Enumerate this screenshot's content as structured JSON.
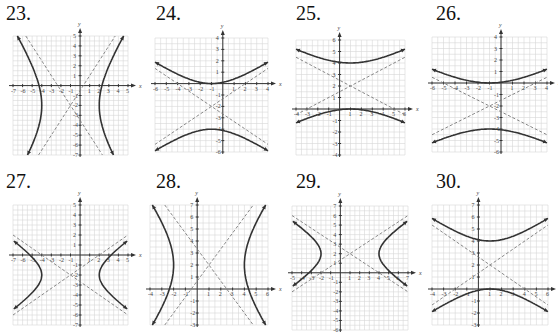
{
  "chart_data": [
    {
      "id": "23",
      "type": "line",
      "title": "23.",
      "xlabel": "x",
      "ylabel": "y",
      "xlim": [
        -7,
        5
      ],
      "ylim": [
        -7,
        5
      ],
      "grid": true,
      "orientation": "horizontal",
      "center": [
        -1,
        -2
      ],
      "a": 3,
      "b": 4.5,
      "xticks": [
        -7,
        -6,
        -5,
        -4,
        -3,
        -2,
        -1,
        1,
        2,
        3,
        4,
        5
      ],
      "yticks": [
        -7,
        -6,
        -5,
        -4,
        -3,
        -2,
        -1,
        1,
        2,
        3,
        4,
        5
      ]
    },
    {
      "id": "24",
      "type": "line",
      "title": "24.",
      "xlabel": "x",
      "ylabel": "y",
      "xlim": [
        -6,
        4
      ],
      "ylim": [
        -6,
        4
      ],
      "grid": true,
      "orientation": "vertical",
      "center": [
        -1,
        -2
      ],
      "a": 2,
      "b": 3,
      "xticks": [
        -6,
        -5,
        -4,
        -3,
        -2,
        -1,
        1,
        2,
        3,
        4
      ],
      "yticks": [
        -6,
        -5,
        -4,
        -3,
        -2,
        -1,
        1,
        2,
        3,
        4
      ]
    },
    {
      "id": "25",
      "type": "line",
      "title": "25.",
      "xlabel": "x",
      "ylabel": "y",
      "xlim": [
        -4,
        6
      ],
      "ylim": [
        -4,
        6
      ],
      "grid": true,
      "orientation": "vertical",
      "center": [
        1,
        2
      ],
      "a": 2,
      "b": 4,
      "xticks": [
        -4,
        -3,
        -2,
        -1,
        1,
        2,
        3,
        4,
        5,
        6
      ],
      "yticks": [
        -4,
        -3,
        -2,
        -1,
        1,
        2,
        3,
        4,
        5,
        6
      ]
    },
    {
      "id": "26",
      "type": "line",
      "title": "26.",
      "xlabel": "x",
      "ylabel": "y",
      "xlim": [
        -6,
        4
      ],
      "ylim": [
        -6,
        4
      ],
      "grid": true,
      "orientation": "vertical",
      "center": [
        -1,
        -2
      ],
      "a": 2,
      "b": 4,
      "xticks": [
        -6,
        -5,
        -4,
        -3,
        -2,
        -1,
        1,
        2,
        3,
        4
      ],
      "yticks": [
        -6,
        -5,
        -4,
        -3,
        -2,
        -1,
        1,
        2,
        3,
        4
      ]
    },
    {
      "id": "27",
      "type": "line",
      "title": "27.",
      "xlabel": "x",
      "ylabel": "y",
      "xlim": [
        -7,
        5
      ],
      "ylim": [
        -7,
        5
      ],
      "grid": true,
      "orientation": "horizontal",
      "center": [
        -1,
        -2
      ],
      "a": 3,
      "b": 2,
      "xticks": [
        -7,
        -6,
        -5,
        -4,
        -3,
        -2,
        -1,
        1,
        2,
        3,
        4,
        5
      ],
      "yticks": [
        -7,
        -6,
        -5,
        -4,
        -3,
        -2,
        -1,
        1,
        2,
        3,
        4,
        5
      ]
    },
    {
      "id": "28",
      "type": "line",
      "title": "28.",
      "xlabel": "x",
      "ylabel": "y",
      "xlim": [
        -4,
        6
      ],
      "ylim": [
        -3,
        7
      ],
      "grid": true,
      "orientation": "horizontal",
      "center": [
        1,
        2
      ],
      "a": 3,
      "b": 4,
      "xticks": [
        -4,
        -3,
        -2,
        -1,
        1,
        2,
        3,
        4,
        5,
        6
      ],
      "yticks": [
        -3,
        -2,
        -1,
        1,
        2,
        3,
        4,
        5,
        6,
        7
      ]
    },
    {
      "id": "29",
      "type": "line",
      "title": "29.",
      "xlabel": "x",
      "ylabel": "y",
      "xlim": [
        -5,
        7
      ],
      "ylim": [
        -6,
        7
      ],
      "grid": true,
      "orientation": "horizontal",
      "center": [
        1,
        2
      ],
      "a": 3,
      "b": 2,
      "xticks": [
        -5,
        -4,
        -3,
        -2,
        -1,
        1,
        2,
        3,
        4,
        5,
        6,
        7
      ],
      "yticks": [
        -6,
        -5,
        -4,
        -3,
        -2,
        -1,
        1,
        2,
        3,
        4,
        5,
        6,
        7
      ]
    },
    {
      "id": "30",
      "type": "line",
      "title": "30.",
      "xlabel": "x",
      "ylabel": "y",
      "xlim": [
        -4,
        6
      ],
      "ylim": [
        -3,
        7
      ],
      "grid": true,
      "orientation": "vertical",
      "center": [
        1,
        2
      ],
      "a": 2,
      "b": 3,
      "xticks": [
        -4,
        -3,
        -2,
        -1,
        1,
        2,
        3,
        4,
        5,
        6
      ],
      "yticks": [
        -3,
        -2,
        -1,
        1,
        2,
        3,
        4,
        5,
        6,
        7
      ]
    }
  ]
}
